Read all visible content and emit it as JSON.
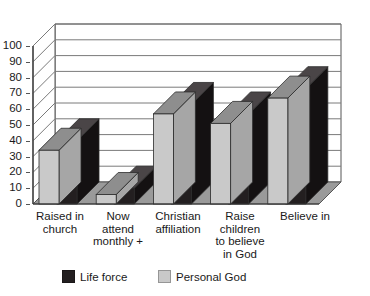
{
  "chart_data": {
    "type": "bar",
    "title": "",
    "subtitle": "",
    "xlabel": "",
    "ylabel": "",
    "ylim": [
      0,
      100
    ],
    "ytick_step": 10,
    "yticks": [
      0,
      10,
      20,
      30,
      40,
      50,
      60,
      70,
      80,
      90,
      100
    ],
    "grid": true,
    "grid_axis": "y",
    "three_d": true,
    "legend_position": "bottom",
    "categories": [
      "Raised in church",
      "Now attend monthly +",
      "Christian affiliation",
      "Raise children to believe in God",
      "Believe in"
    ],
    "category_label_lines": [
      [
        "Raised in",
        "church"
      ],
      [
        "Now",
        "attend",
        "monthly +"
      ],
      [
        "Christian",
        "affiliation"
      ],
      [
        "Raise",
        "children",
        "to believe",
        "in God"
      ],
      [
        "Believe in"
      ]
    ],
    "series": [
      {
        "name": "Life force",
        "color": "#231f20",
        "values": [
          40,
          10,
          63,
          57,
          73
        ]
      },
      {
        "name": "Personal God",
        "color": "#c9c9c9",
        "values": [
          34,
          6,
          57,
          51,
          67
        ]
      }
    ]
  },
  "legend": {
    "items": [
      {
        "label": "Life force",
        "color": "#231f20"
      },
      {
        "label": "Personal God",
        "color": "#c9c9c9"
      }
    ]
  },
  "top_remnant": {
    "text": ""
  },
  "colors": {
    "axis": "#555555",
    "grid": "#7a7a7a",
    "plot_background": "#ffffff",
    "floor": "#9a9a9a",
    "wall": "#ffffff",
    "life_force": "#231f20",
    "life_force_top": "#4a4547",
    "personal_god": "#c9c9c9",
    "personal_god_top": "#8e8e8e",
    "text": "#1a1a1a"
  }
}
